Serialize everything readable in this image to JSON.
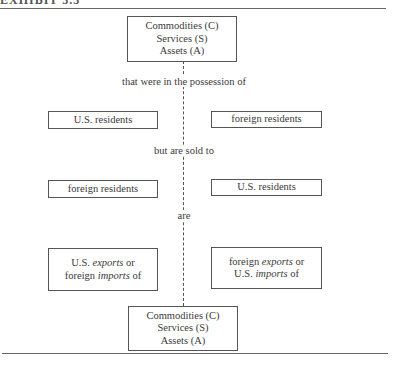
{
  "header": {
    "cutoff_text": "EXHIBIT 3.3"
  },
  "diagram": {
    "top_box": {
      "lines": [
        "Commodities (C)",
        "Services (S)",
        "Assets (A)"
      ]
    },
    "connectors": [
      "that were in the possession of",
      "but are sold to",
      "are"
    ],
    "row1": {
      "left": "U.S. residents",
      "right": "foreign residents"
    },
    "row2": {
      "left": "foreign residents",
      "right": "U.S. residents"
    },
    "row3": {
      "left": {
        "line1_plain": "U.S. ",
        "line1_italic": "exports",
        "line1_tail": " or",
        "line2_plain": "foreign ",
        "line2_italic": "imports",
        "line2_tail": " of"
      },
      "right": {
        "line1_plain": "foreign ",
        "line1_italic": "exports",
        "line1_tail": " or",
        "line2_plain": "U.S. ",
        "line2_italic": "imports",
        "line2_tail": " of"
      }
    },
    "bottom_box": {
      "lines": [
        "Commodities (C)",
        "Services (S)",
        "Assets (A)"
      ]
    }
  }
}
